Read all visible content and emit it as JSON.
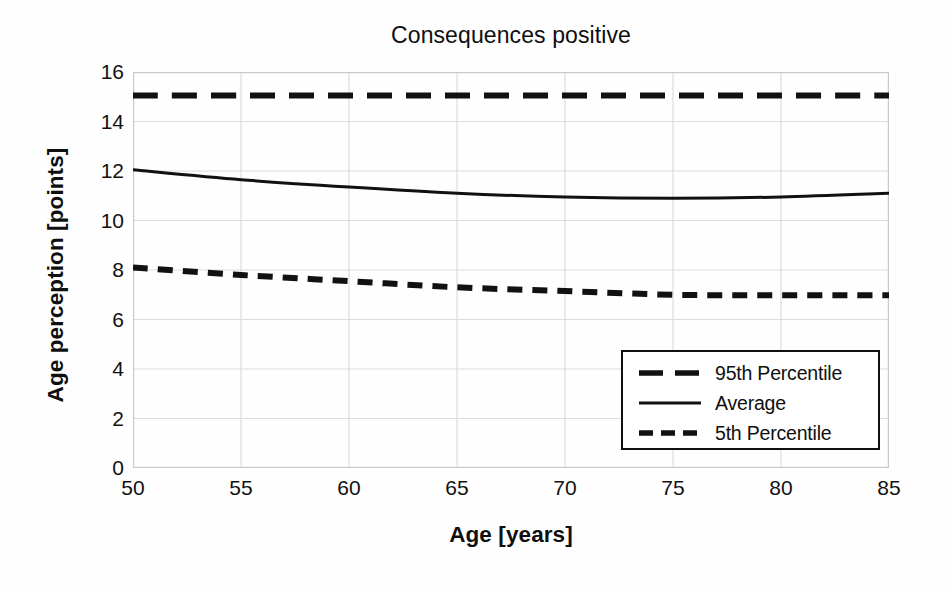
{
  "chart_data": {
    "type": "line",
    "title": "Consequences positive",
    "xlabel": "Age [years]",
    "ylabel": "Age perception [points]",
    "xlim": [
      50,
      85
    ],
    "ylim": [
      0,
      16
    ],
    "xticks": [
      50,
      55,
      60,
      65,
      70,
      75,
      80,
      85
    ],
    "yticks": [
      0,
      2,
      4,
      6,
      8,
      10,
      12,
      14,
      16
    ],
    "grid": true,
    "grid_axis": "both",
    "legend_position": "lower right",
    "x": [
      50,
      55,
      60,
      65,
      70,
      75,
      80,
      85
    ],
    "series": [
      {
        "name": "95th Percentile",
        "style": "dashed-long",
        "color": "#111111",
        "values": [
          15.05,
          15.05,
          15.05,
          15.05,
          15.05,
          15.05,
          15.05,
          15.05
        ]
      },
      {
        "name": "Average",
        "style": "solid",
        "color": "#111111",
        "values": [
          12.05,
          11.65,
          11.35,
          11.1,
          10.95,
          10.9,
          10.95,
          11.1
        ]
      },
      {
        "name": "5th Percentile",
        "style": "dashed-short",
        "color": "#111111",
        "values": [
          8.1,
          7.8,
          7.55,
          7.3,
          7.15,
          7.0,
          6.98,
          6.98
        ]
      }
    ]
  },
  "legend": {
    "entries": [
      {
        "label": "95th Percentile"
      },
      {
        "label": "Average"
      },
      {
        "label": "5th Percentile"
      }
    ]
  },
  "colors": {
    "line": "#111111",
    "grid": "#dcdcdc",
    "axis": "#c9c9c9",
    "background": "#fefefe",
    "text": "#0f0f0f"
  }
}
